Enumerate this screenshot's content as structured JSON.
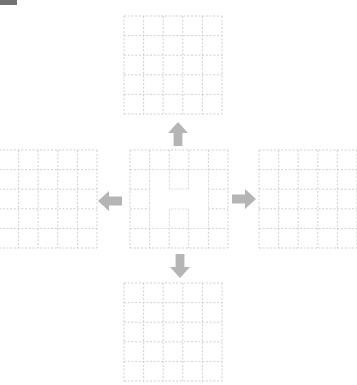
{
  "page": {
    "background_color": "#ffffff",
    "width": 357,
    "height": 385
  },
  "style": {
    "grid_line_color": "#c8c8c8",
    "grid_border_color": "#c8c8c8",
    "shape_stroke_color": "#4a4a4a",
    "shape_fill_color": "#ffffff",
    "arrow_color": "#b5b5b5",
    "corner_mark_color": "#5a5a5a"
  },
  "corner_mark": {
    "label": "page-artifact"
  },
  "grids": [
    {
      "id": "center",
      "name": "center-grid",
      "label": "Center grid with H shape",
      "rows": 5,
      "cols": 5,
      "x": 130,
      "y": 150,
      "width": 98,
      "height": 98,
      "has_shape": true,
      "clipped": false
    },
    {
      "id": "top",
      "name": "top-grid",
      "label": "Top answer grid",
      "rows": 5,
      "cols": 5,
      "x": 124,
      "y": 16,
      "width": 98,
      "height": 98,
      "has_shape": false,
      "clipped": false
    },
    {
      "id": "right",
      "name": "right-grid",
      "label": "Right answer grid",
      "rows": 5,
      "cols": 5,
      "x": 259,
      "y": 150,
      "width": 98,
      "height": 98,
      "has_shape": false,
      "clipped": true
    },
    {
      "id": "bottom",
      "name": "bottom-grid",
      "label": "Bottom answer grid",
      "rows": 5,
      "cols": 5,
      "x": 124,
      "y": 283,
      "width": 98,
      "height": 98,
      "has_shape": false,
      "clipped": true
    },
    {
      "id": "left",
      "name": "left-grid",
      "label": "Left answer grid",
      "rows": 5,
      "cols": 5,
      "x": -1,
      "y": 150,
      "width": 98,
      "height": 98,
      "has_shape": false,
      "clipped": true
    }
  ],
  "shape": {
    "name": "h-shape-polygon",
    "letter": "H",
    "grid_cells": 5,
    "stroke_width": 1.6,
    "points": "1,1 2,1 2,2 3,2 3,1 4,1 4,4 3,4 3,3 2,3 2,4 1,4"
  },
  "arrows": [
    {
      "id": "up",
      "name": "arrow-up",
      "direction": "up",
      "label": "Up arrow",
      "x": 166,
      "y": 121,
      "width": 24,
      "height": 26
    },
    {
      "id": "right",
      "name": "arrow-right",
      "direction": "right",
      "label": "Right arrow",
      "x": 231,
      "y": 187,
      "width": 26,
      "height": 24
    },
    {
      "id": "down",
      "name": "arrow-down",
      "direction": "down",
      "label": "Down arrow",
      "x": 166,
      "y": 253,
      "width": 24,
      "height": 26
    },
    {
      "id": "left",
      "name": "arrow-left",
      "direction": "left",
      "label": "Left arrow",
      "x": 97,
      "y": 187,
      "width": 26,
      "height": 24
    }
  ]
}
